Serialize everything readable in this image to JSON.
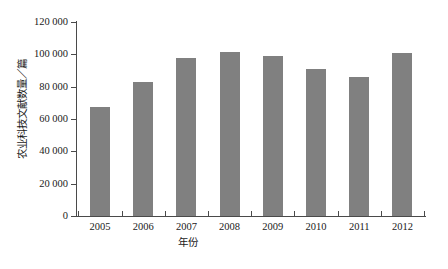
{
  "chart_data": {
    "type": "bar",
    "title": "",
    "xlabel": "年份",
    "ylabel": "农业科技文献数量／篇",
    "categories": [
      "2005",
      "2006",
      "2007",
      "2008",
      "2009",
      "2010",
      "2011",
      "2012"
    ],
    "values": [
      67400,
      82900,
      97700,
      101400,
      99000,
      90900,
      86000,
      100800
    ],
    "ylim": [
      0,
      120000
    ],
    "ytick_values": [
      0,
      20000,
      40000,
      60000,
      80000,
      100000,
      120000
    ],
    "ytick_labels": [
      "0",
      "20 000",
      "40 000",
      "60 000",
      "80 000",
      "100 000",
      "120 000"
    ],
    "grid": false,
    "legend": null,
    "legend_position": "none",
    "bar_color": "#808080",
    "axis_color": "#4a4a4a",
    "text_color": "#1a1a1a",
    "background": "#ffffff"
  }
}
